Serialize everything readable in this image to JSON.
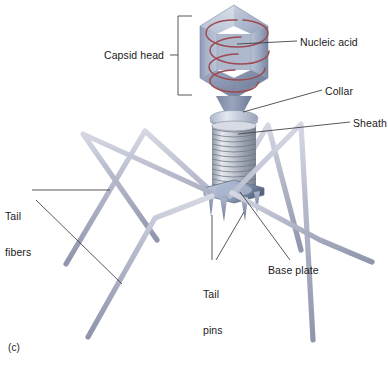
{
  "figure": {
    "panel_label": "(c)",
    "background_color": "#ffffff"
  },
  "labels": {
    "capsid_head": "Capsid head",
    "nucleic_acid": "Nucleic acid",
    "collar": "Collar",
    "sheath": "Sheath",
    "tail_fibers_line1": "Tail",
    "tail_fibers_line2": "fibers",
    "tail_pins_line1": "Tail",
    "tail_pins_line2": "pins",
    "base_plate": "Base plate"
  },
  "colors": {
    "capsid_light": "#c3cbdd",
    "capsid_mid": "#a7b2c9",
    "capsid_dark": "#7f8ba8",
    "capsid_shadow": "#68738f",
    "nucleic_acid": "#9e4a50",
    "nucleic_acid_light": "#b06066",
    "collar": "#ccd3e0",
    "sheath_light": "#e2e5ec",
    "sheath_mid": "#b3b9c7",
    "sheath_dark": "#8a92a4",
    "base_plate": "#b6c1d6",
    "base_plate_dark": "#5d6a86",
    "tail_fiber": "#b9bccd",
    "tail_fiber_dark": "#8f95ac",
    "tail_pin": "#9aa5bd",
    "leader_line": "#3a3a3a",
    "text": "#1a1a1a"
  },
  "structure": {
    "capsid_sides": 6,
    "nucleic_acid_turns": 4,
    "sheath_ribs": 13,
    "tail_fiber_count": 6,
    "tail_pin_count": 4
  }
}
